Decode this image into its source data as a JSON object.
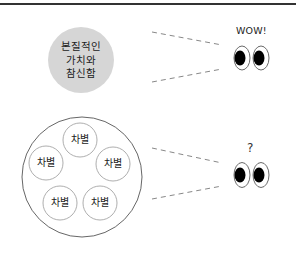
{
  "diagram": {
    "top_concept": {
      "label_lines": [
        "본질적인",
        "가치와",
        "참신함"
      ],
      "fill_color": "#d6d6d6"
    },
    "bottom_concept": {
      "items": [
        "차별",
        "차별",
        "차별",
        "차별",
        "차별"
      ],
      "outline_color": "#555555"
    },
    "viewer_top": {
      "reaction": "WOW!"
    },
    "viewer_bottom": {
      "reaction": "?"
    }
  }
}
